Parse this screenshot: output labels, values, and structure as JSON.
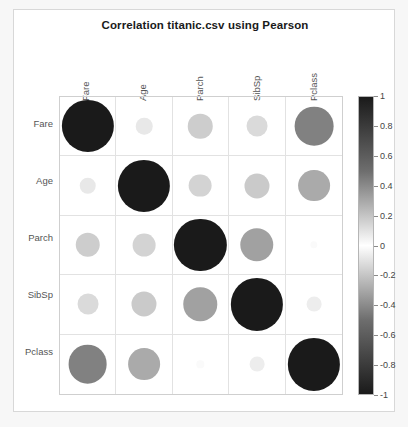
{
  "figure": {
    "title": "Correlation titanic.csv using Pearson"
  },
  "axes": {
    "column_labels": [
      "Fare",
      "Age",
      "Parch",
      "SibSp",
      "Pclass"
    ],
    "row_labels": [
      "Fare",
      "Age",
      "Parch",
      "SibSp",
      "Pclass"
    ]
  },
  "colorbar": {
    "ticks": [
      "1",
      "0.8",
      "0.6",
      "0.4",
      "0.2",
      "0",
      "-0.2",
      "-0.4",
      "-0.6",
      "-0.8",
      "-1"
    ],
    "tick_values": [
      1,
      0.8,
      0.6,
      0.4,
      0.2,
      0,
      -0.2,
      -0.4,
      -0.6,
      -0.8,
      -1
    ],
    "vmin": -1,
    "vmax": 1,
    "colormap": "grayscale-diverging"
  },
  "chart_data": {
    "type": "heatmap",
    "title": "Correlation titanic.csv using Pearson",
    "xlabel": "",
    "ylabel": "",
    "categories": [
      "Fare",
      "Age",
      "Parch",
      "SibSp",
      "Pclass"
    ],
    "x": [
      "Fare",
      "Age",
      "Parch",
      "SibSp",
      "Pclass"
    ],
    "y": [
      "Fare",
      "Age",
      "Parch",
      "SibSp",
      "Pclass"
    ],
    "zlim": [
      -1,
      1
    ],
    "grid": true,
    "legend_position": "right",
    "marker_encoding": "circle area proportional to absolute correlation; fill shade from colorbar",
    "values": [
      [
        1.0,
        0.1,
        0.22,
        0.16,
        -0.55
      ],
      [
        0.1,
        1.0,
        -0.19,
        -0.23,
        -0.37
      ],
      [
        0.22,
        -0.19,
        1.0,
        0.41,
        0.02
      ],
      [
        0.16,
        -0.23,
        0.41,
        1.0,
        0.08
      ],
      [
        -0.55,
        -0.37,
        0.02,
        0.08,
        1.0
      ]
    ],
    "series": [
      {
        "name": "Fare",
        "values": [
          1.0,
          0.1,
          0.22,
          0.16,
          -0.55
        ]
      },
      {
        "name": "Age",
        "values": [
          0.1,
          1.0,
          -0.19,
          -0.23,
          -0.37
        ]
      },
      {
        "name": "Parch",
        "values": [
          0.22,
          -0.19,
          1.0,
          0.41,
          0.02
        ]
      },
      {
        "name": "SibSp",
        "values": [
          0.16,
          -0.23,
          0.41,
          1.0,
          0.08
        ]
      },
      {
        "name": "Pclass",
        "values": [
          -0.55,
          -0.37,
          0.02,
          0.08,
          1.0
        ]
      }
    ]
  }
}
